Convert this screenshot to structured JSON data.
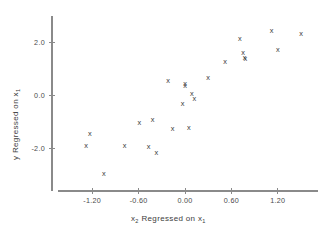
{
  "chart_data": {
    "type": "scatter",
    "title": "",
    "xlabel": "x2 Regressed on x1",
    "ylabel": "y Regressed on x1",
    "xlabel_base": "x",
    "xlabel_sub": "2",
    "xlabel_rest": "Regressed on",
    "xlabel_tail_base": "x",
    "xlabel_tail_sub": "1",
    "ylabel_base": "y",
    "ylabel_rest": "Regressed on",
    "ylabel_tail_base": "x",
    "ylabel_tail_sub": "1",
    "marker_glyph": "x",
    "grid": false,
    "legend": "none",
    "xlim": [
      -1.72,
      1.72
    ],
    "ylim": [
      -3.6,
      3.0
    ],
    "xticks": [
      -1.2,
      -0.6,
      0.0,
      0.6,
      1.2
    ],
    "xticklabels": [
      "-1.20",
      "-0.60",
      "0.00",
      "0.60",
      "1.20"
    ],
    "yticks": [
      2.0,
      0.0,
      -2.0
    ],
    "yticklabels": [
      "2.0",
      "0.0",
      "-2.0"
    ],
    "n_points": 29,
    "points": [
      {
        "x": -1.23,
        "y": -1.45
      },
      {
        "x": -1.28,
        "y": -1.92
      },
      {
        "x": -1.05,
        "y": -2.95
      },
      {
        "x": -0.78,
        "y": -1.92
      },
      {
        "x": -0.59,
        "y": -1.05
      },
      {
        "x": -0.47,
        "y": -1.93
      },
      {
        "x": -0.42,
        "y": -0.93
      },
      {
        "x": -0.37,
        "y": -2.15
      },
      {
        "x": -0.22,
        "y": 0.55
      },
      {
        "x": -0.16,
        "y": -1.27
      },
      {
        "x": 0.0,
        "y": 0.44
      },
      {
        "x": 0.0,
        "y": 0.36
      },
      {
        "x": 0.05,
        "y": -1.22
      },
      {
        "x": -0.03,
        "y": -0.31
      },
      {
        "x": 0.09,
        "y": 0.06
      },
      {
        "x": 0.12,
        "y": -0.12
      },
      {
        "x": 0.3,
        "y": 0.67
      },
      {
        "x": 0.52,
        "y": 1.26
      },
      {
        "x": 0.71,
        "y": 2.13
      },
      {
        "x": 0.75,
        "y": 1.62
      },
      {
        "x": 0.77,
        "y": 1.41
      },
      {
        "x": 0.78,
        "y": 1.38
      },
      {
        "x": 1.12,
        "y": 2.42
      },
      {
        "x": 1.2,
        "y": 1.73
      },
      {
        "x": 1.5,
        "y": 2.33
      }
    ]
  },
  "colors": {
    "background": "#ffffff",
    "axis": "#8a8a8a",
    "text": "#3d3d3d",
    "marker": "#3a3a3a"
  }
}
